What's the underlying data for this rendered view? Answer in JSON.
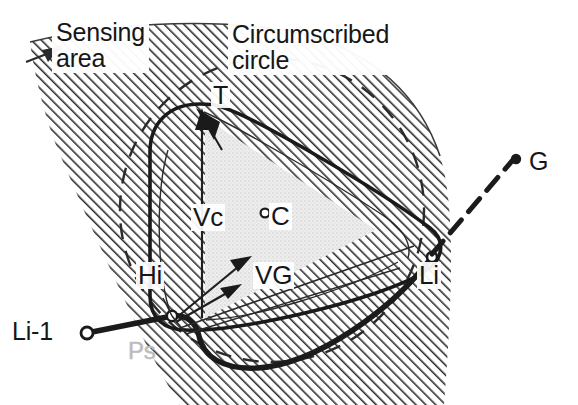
{
  "figure": {
    "type": "technical-diagram",
    "background_color": "#ffffff",
    "ink_color": "#161616",
    "hatch_color": "#2a2a2a",
    "fill_light_gray": "#e3e3e3",
    "ghost_color": "#bdbdbd"
  },
  "labels": {
    "sensing_area": "Sensing\narea",
    "sensing_area_line1": "Sensing",
    "sensing_area_line2": "area",
    "circumscribed": "Circumscribed\ncircle",
    "circumscribed_line1": "Circumscribed",
    "circumscribed_line2": "circle",
    "vertex_T": "T",
    "vector_Vc": "Vc",
    "center_C": "C",
    "vector_VG": "VG",
    "point_Hi": "Hi",
    "point_Li": "Li",
    "point_Li_minus_1": "Li-1",
    "goal_G": "G",
    "path_Ps": "Ps"
  },
  "annotations": {
    "center_marker": "open-circle",
    "goal_marker": "filled-dot",
    "li_minus_1_marker": "open-circle",
    "li_marker": "open-circle",
    "goal_connector_style": "dashed",
    "circumscribed_circle_style": "dashed",
    "sensing_area_fill": "diagonal-hatch",
    "inner_triangle_fill": "light-stipple"
  },
  "geometry": {
    "circumscribed_circle": {
      "cx": 272,
      "cy": 210,
      "r": 152
    },
    "center_point": {
      "x": 262,
      "y": 213
    },
    "vertex_T": {
      "x": 200,
      "y": 106
    },
    "point_Hi": {
      "x": 172,
      "y": 316
    },
    "point_Li": {
      "x": 432,
      "y": 257
    },
    "point_Li_minus_1": {
      "x": 87,
      "y": 333
    },
    "goal_G": {
      "x": 516,
      "y": 160
    }
  },
  "vectors": [
    {
      "name": "Vc",
      "from": "Hi",
      "to": "T",
      "label": "Vc"
    },
    {
      "name": "VG",
      "from": "Hi",
      "to": "Li",
      "label": "VG"
    }
  ]
}
